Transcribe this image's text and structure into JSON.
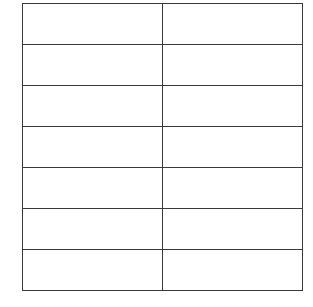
{
  "table": {
    "columns": 2,
    "border_color": "#3a3a3a",
    "rows": [
      [
        "",
        ""
      ],
      [
        "",
        ""
      ],
      [
        "",
        ""
      ],
      [
        "",
        ""
      ],
      [
        "",
        ""
      ],
      [
        "",
        ""
      ],
      [
        "",
        ""
      ]
    ]
  }
}
